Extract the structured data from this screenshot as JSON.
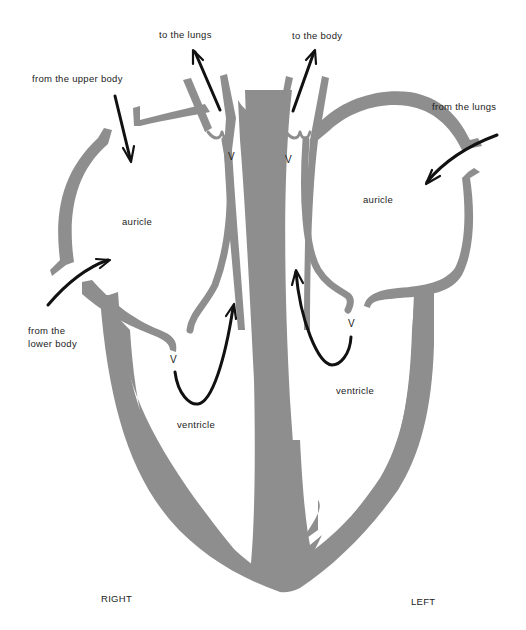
{
  "diagram": {
    "wall_color": "#8e8e8e",
    "arrow_color": "#111111",
    "labels": {
      "to_lungs": "to the lungs",
      "to_body": "to the body",
      "from_upper_body": "from the upper body",
      "from_lungs": "from the lungs",
      "from_lower_body_1": "from the",
      "from_lower_body_2": "lower body",
      "right_auricle": "auricle",
      "left_auricle": "auricle",
      "right_ventricle": "ventricle",
      "left_ventricle": "ventricle",
      "valve_pulmonary": "V",
      "valve_aortic": "V",
      "valve_right_av": "V",
      "valve_left_av": "V",
      "side_right": "RIGHT",
      "side_left": "LEFT"
    }
  }
}
